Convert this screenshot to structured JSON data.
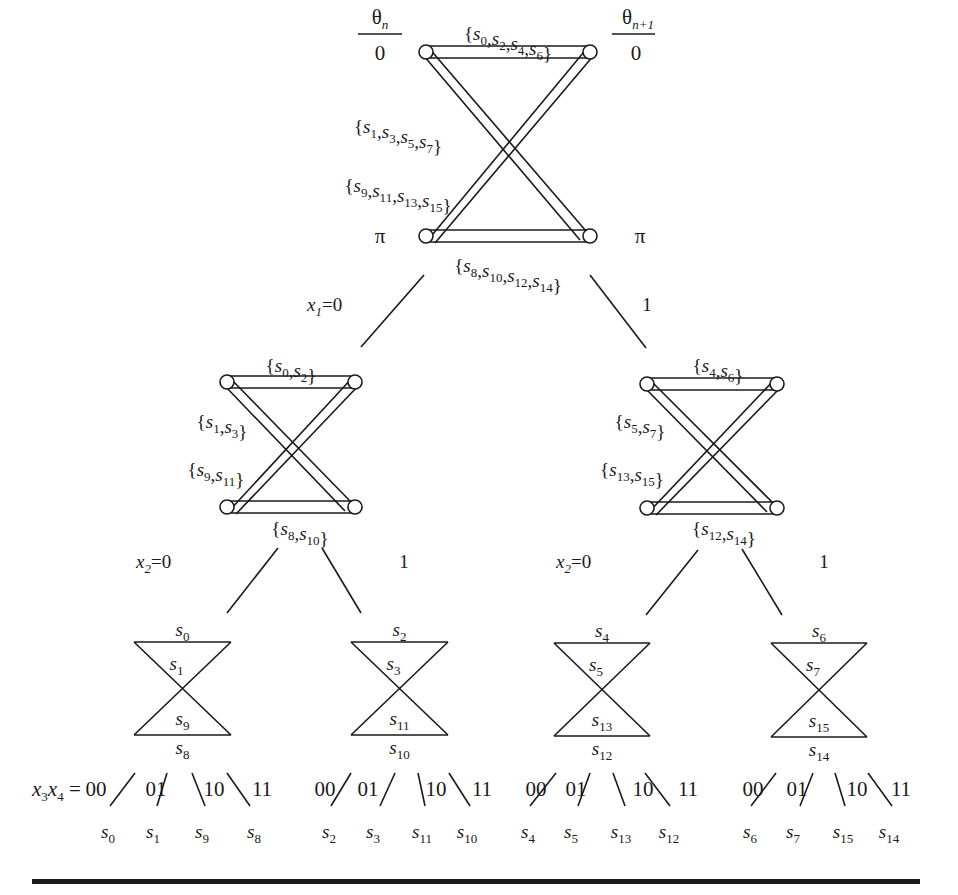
{
  "diagram": {
    "colors": {
      "ink": "#1a1a1a",
      "background": "#ffffff"
    },
    "phase_headers": {
      "left": {
        "label": "θ",
        "sub": "n",
        "value": "0",
        "value_bottom": "π"
      },
      "right": {
        "label": "θ",
        "sub": "n+1",
        "value": "0",
        "value_bottom": "π"
      }
    },
    "level0": {
      "top_set": [
        "s0",
        "s2",
        "s4",
        "s6"
      ],
      "cross1_set": [
        "s1",
        "s3",
        "s5",
        "s7"
      ],
      "cross2_set": [
        "s9",
        "s11",
        "s13",
        "s15"
      ],
      "bottom_set": [
        "s8",
        "s10",
        "s12",
        "s14"
      ]
    },
    "branch_x1": {
      "var": "x",
      "var_sub": "1",
      "left": "0",
      "right": "1"
    },
    "level1": [
      {
        "top_set": [
          "s0",
          "s2"
        ],
        "cross1_set": [
          "s1",
          "s3"
        ],
        "cross2_set": [
          "s9",
          "s11"
        ],
        "bottom_set": [
          "s8",
          "s10"
        ]
      },
      {
        "top_set": [
          "s4",
          "s6"
        ],
        "cross1_set": [
          "s5",
          "s7"
        ],
        "cross2_set": [
          "s13",
          "s15"
        ],
        "bottom_set": [
          "s12",
          "s14"
        ]
      }
    ],
    "branch_x2": [
      {
        "var": "x",
        "var_sub": "2",
        "left": "0",
        "right": "1"
      },
      {
        "var": "x",
        "var_sub": "2",
        "left": "0",
        "right": "1"
      }
    ],
    "level2": [
      {
        "top": "s0",
        "cross1": "s1",
        "cross2": "s9",
        "bottom": "s8"
      },
      {
        "top": "s2",
        "cross1": "s3",
        "cross2": "s11",
        "bottom": "s10"
      },
      {
        "top": "s4",
        "cross1": "s5",
        "cross2": "s13",
        "bottom": "s12"
      },
      {
        "top": "s6",
        "cross1": "s7",
        "cross2": "s15",
        "bottom": "s14"
      }
    ],
    "branch_x3x4": {
      "var_label": "x3x4 =",
      "codes": [
        "00",
        "01",
        "10",
        "11"
      ]
    },
    "leaves": [
      [
        "s0",
        "s1",
        "s9",
        "s8"
      ],
      [
        "s2",
        "s3",
        "s11",
        "s10"
      ],
      [
        "s4",
        "s5",
        "s13",
        "s12"
      ],
      [
        "s6",
        "s7",
        "s15",
        "s14"
      ]
    ]
  }
}
